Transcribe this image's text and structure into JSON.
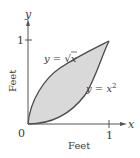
{
  "diagram": {
    "axes": {
      "x_label": "x",
      "y_label": "y",
      "x_title": "Feet",
      "y_title": "Feet",
      "origin_label": "0",
      "x_tick_label": "1",
      "y_tick_label": "1"
    },
    "curves": [
      {
        "name": "sqrt",
        "label_lhs": "y = ",
        "label_rhs": "x",
        "radical": "√"
      },
      {
        "name": "square",
        "label_lhs": "y = x",
        "exponent": "2"
      }
    ],
    "colors": {
      "curve": "#4a4a4a",
      "fill": "#d9d9d9",
      "axis": "#555555",
      "text": "#3a3a3a"
    }
  }
}
